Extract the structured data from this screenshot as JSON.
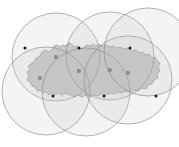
{
  "figure": {
    "width": 179,
    "height": 147,
    "background_color": "#ffffff"
  },
  "colors": {
    "region_fill": "#c9c9c9",
    "region_stroke": "#8f8f8f",
    "circle_stroke": "#8a8a8a",
    "circle_fill": "#bdbdbd",
    "facility_marker": "#8a8a8a",
    "demand_point": "#1a1a1a"
  },
  "chart_data": {
    "type": "scatter",
    "subtitle": "",
    "xlabel": "",
    "ylabel": "",
    "xlim": [
      0,
      179
    ],
    "ylim": [
      0,
      147
    ],
    "grid": false,
    "legend": null,
    "series": [
      {
        "name": "Coverage circles",
        "shape": "circle",
        "radius": 44,
        "values": [
          {
            "label": "C1",
            "cx": 56,
            "cy": 57
          },
          {
            "label": "C2",
            "cx": 110,
            "cy": 56
          },
          {
            "label": "C3",
            "cx": 46,
            "cy": 91
          },
          {
            "label": "C4",
            "cx": 86,
            "cy": 92
          },
          {
            "label": "C5",
            "cx": 128,
            "cy": 80
          },
          {
            "label": "C6",
            "cx": 148,
            "cy": 52
          }
        ]
      },
      {
        "name": "Facility centers",
        "shape": "square",
        "size": 3,
        "values": [
          {
            "label": "F1",
            "cx": 56,
            "cy": 57
          },
          {
            "label": "F2",
            "cx": 79,
            "cy": 71
          },
          {
            "label": "F3",
            "cx": 110,
            "cy": 70
          },
          {
            "label": "F4",
            "cx": 128,
            "cy": 73
          },
          {
            "label": "F5",
            "cx": 40,
            "cy": 78
          }
        ]
      },
      {
        "name": "Demand points",
        "shape": "dot",
        "size": 3,
        "values": [
          {
            "label": "D1",
            "cx": 25,
            "cy": 48
          },
          {
            "label": "D2",
            "cx": 79,
            "cy": 48
          },
          {
            "label": "D3",
            "cx": 130,
            "cy": 48
          },
          {
            "label": "D4",
            "cx": 53,
            "cy": 96
          },
          {
            "label": "D5",
            "cx": 104,
            "cy": 96
          },
          {
            "label": "D6",
            "cx": 156,
            "cy": 96
          }
        ]
      }
    ],
    "region": {
      "name": "Study region",
      "outline": "M 34,62 L 36,58 L 40,56 L 42,52 L 46,50 L 48,52 L 52,50 L 54,46 L 58,45 L 60,47 L 63,45 L 66,46 L 68,43 L 72,44 L 74,47 L 78,46 L 80,49 L 84,48 L 86,45 L 90,46 L 93,44 L 96,46 L 99,44 L 102,46 L 106,45 L 109,47 L 113,46 L 116,48 L 120,47 L 124,49 L 128,48 L 132,51 L 136,50 L 140,53 L 143,52 L 146,55 L 149,54 L 152,58 L 155,57 L 157,61 L 160,63 L 158,67 L 160,71 L 157,74 L 158,78 L 154,80 L 152,84 L 148,85 L 146,89 L 142,88 L 138,91 L 134,90 L 130,92 L 126,91 L 122,93 L 118,92 L 114,94 L 110,93 L 106,95 L 102,94 L 98,96 L 94,95 L 90,97 L 86,95 L 82,97 L 78,95 L 74,97 L 70,95 L 66,93 L 62,95 L 58,93 L 55,95 L 52,93 L 49,95 L 46,92 L 43,93 L 40,90 L 37,91 L 35,87 L 32,86 L 30,82 L 27,80 L 29,76 L 27,72 L 30,69 L 28,66 Z"
    }
  }
}
